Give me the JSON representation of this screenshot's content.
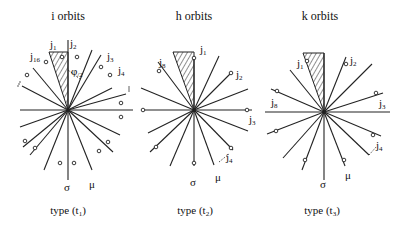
{
  "panels": [
    {
      "title": "i orbits",
      "caption": "type (t",
      "caption_sub": "1",
      "caption_end": ")",
      "labels": {
        "j1": "j",
        "j1_sub": "1",
        "j2": "j",
        "j2_sub": "2",
        "j16": "j",
        "j16_sub": "16",
        "j3": "j",
        "j3_sub": "3",
        "j4": "j",
        "j4_sub": "4",
        "phi": "φ",
        "phi_sub": "/2",
        "sigma": "σ",
        "mu": "μ"
      }
    },
    {
      "title": "h orbits",
      "caption": "type (t",
      "caption_sub": "2",
      "caption_end": ")",
      "labels": {
        "j1": "j",
        "j1_sub": "1",
        "j8": "j",
        "j8_sub": "8",
        "j2": "j",
        "j2_sub": "2",
        "j3": "j",
        "j3_sub": "3",
        "j4": "j",
        "j4_sub": "4",
        "sigma": "σ",
        "mu": "μ"
      }
    },
    {
      "title": "k orbits",
      "caption": "type (t",
      "caption_sub": "3",
      "caption_end": ")",
      "labels": {
        "j1": "j",
        "j1_sub": "1",
        "j2": "j",
        "j2_sub": "2",
        "j8": "j",
        "j8_sub": "8",
        "j3": "j",
        "j3_sub": "3",
        "j4": "j",
        "j4_sub": "4",
        "sigma": "σ",
        "mu": "μ"
      }
    }
  ]
}
